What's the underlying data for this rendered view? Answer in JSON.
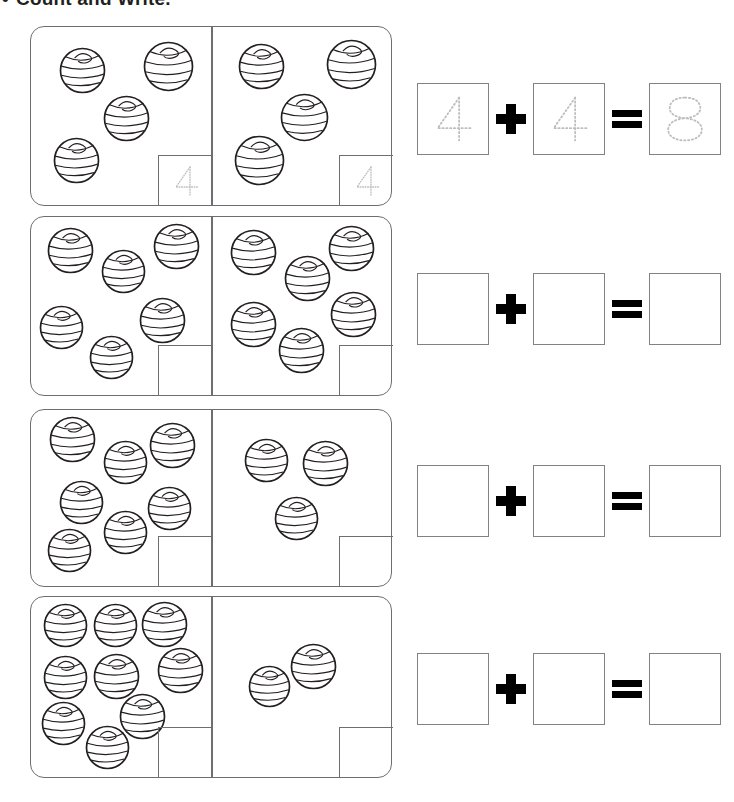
{
  "worksheet": {
    "bullet": "•",
    "title": "Count and Write.",
    "instruction_note": "Count the balls on each half of the domino and write the numbers, then add."
  },
  "colors": {
    "card_stroke": "#6d6e71",
    "box_stroke": "#808285",
    "ball_stroke": "#231f20",
    "trace_dots": "#bcbec0",
    "symbol": "#000000",
    "page_background": "#ffffff"
  },
  "symbols": {
    "plus": "+",
    "equals": "="
  },
  "rows": [
    {
      "id": "row-1",
      "left": {
        "count": 4,
        "answer_value": "4",
        "answer_style": "dotted-trace",
        "balls": [
          {
            "x": 28,
            "y": 20,
            "r": 22
          },
          {
            "x": 112,
            "y": 14,
            "r": 24
          },
          {
            "x": 72,
            "y": 68,
            "r": 22
          },
          {
            "x": 22,
            "y": 110,
            "r": 22
          }
        ]
      },
      "right": {
        "count": 4,
        "answer_value": "4",
        "answer_style": "dotted-trace",
        "balls": [
          {
            "x": 26,
            "y": 16,
            "r": 22
          },
          {
            "x": 114,
            "y": 12,
            "r": 24
          },
          {
            "x": 68,
            "y": 66,
            "r": 23
          },
          {
            "x": 22,
            "y": 108,
            "r": 24
          }
        ]
      },
      "equation": {
        "addend_1": "4",
        "addend_2": "4",
        "sum": "8",
        "style": "dotted-trace",
        "filled": true
      }
    },
    {
      "id": "row-2",
      "left": {
        "count": 6,
        "answer_value": "",
        "answer_style": "blank",
        "balls": [
          {
            "x": 16,
            "y": 10,
            "r": 22
          },
          {
            "x": 70,
            "y": 32,
            "r": 21
          },
          {
            "x": 122,
            "y": 6,
            "r": 22
          },
          {
            "x": 8,
            "y": 88,
            "r": 21
          },
          {
            "x": 108,
            "y": 80,
            "r": 22
          },
          {
            "x": 58,
            "y": 118,
            "r": 21
          }
        ]
      },
      "right": {
        "count": 6,
        "answer_value": "",
        "answer_style": "blank",
        "balls": [
          {
            "x": 18,
            "y": 12,
            "r": 22
          },
          {
            "x": 72,
            "y": 38,
            "r": 22
          },
          {
            "x": 116,
            "y": 8,
            "r": 22
          },
          {
            "x": 18,
            "y": 84,
            "r": 22
          },
          {
            "x": 118,
            "y": 74,
            "r": 22
          },
          {
            "x": 66,
            "y": 110,
            "r": 22
          }
        ]
      },
      "equation": {
        "addend_1": "",
        "addend_2": "",
        "sum": "",
        "style": "blank",
        "filled": false
      }
    },
    {
      "id": "row-3",
      "left": {
        "count": 7,
        "answer_value": "",
        "answer_style": "blank",
        "balls": [
          {
            "x": 18,
            "y": 6,
            "r": 22
          },
          {
            "x": 72,
            "y": 30,
            "r": 21
          },
          {
            "x": 118,
            "y": 12,
            "r": 22
          },
          {
            "x": 28,
            "y": 70,
            "r": 21
          },
          {
            "x": 116,
            "y": 76,
            "r": 21
          },
          {
            "x": 72,
            "y": 100,
            "r": 21
          },
          {
            "x": 16,
            "y": 118,
            "r": 21
          }
        ]
      },
      "right": {
        "count": 3,
        "answer_value": "",
        "answer_style": "blank",
        "balls": [
          {
            "x": 32,
            "y": 28,
            "r": 21
          },
          {
            "x": 90,
            "y": 30,
            "r": 22
          },
          {
            "x": 62,
            "y": 86,
            "r": 21
          }
        ]
      },
      "equation": {
        "addend_1": "",
        "addend_2": "",
        "sum": "",
        "style": "blank",
        "filled": false
      }
    },
    {
      "id": "row-4",
      "left": {
        "count": 9,
        "answer_value": "",
        "answer_style": "blank",
        "balls": [
          {
            "x": 12,
            "y": 6,
            "r": 21
          },
          {
            "x": 62,
            "y": 6,
            "r": 21
          },
          {
            "x": 110,
            "y": 4,
            "r": 22
          },
          {
            "x": 12,
            "y": 58,
            "r": 21
          },
          {
            "x": 62,
            "y": 56,
            "r": 22
          },
          {
            "x": 126,
            "y": 50,
            "r": 22
          },
          {
            "x": 88,
            "y": 96,
            "r": 22
          },
          {
            "x": 10,
            "y": 104,
            "r": 21
          },
          {
            "x": 54,
            "y": 128,
            "r": 21
          }
        ]
      },
      "right": {
        "count": 2,
        "answer_value": "",
        "answer_style": "blank",
        "balls": [
          {
            "x": 36,
            "y": 68,
            "r": 20
          },
          {
            "x": 78,
            "y": 46,
            "r": 22
          }
        ]
      },
      "equation": {
        "addend_1": "",
        "addend_2": "",
        "sum": "",
        "style": "blank",
        "filled": false
      }
    }
  ]
}
